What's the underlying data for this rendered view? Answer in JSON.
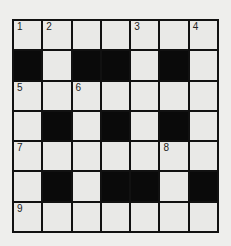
{
  "puzzle": {
    "type": "crossword",
    "rows": 7,
    "cols": 7,
    "colors": {
      "black": "#0a0a0a",
      "white": "#e9e9e7",
      "border": "#111111"
    },
    "grid": [
      [
        {
          "b": false,
          "n": "1"
        },
        {
          "b": false,
          "n": "2"
        },
        {
          "b": false,
          "n": ""
        },
        {
          "b": false,
          "n": ""
        },
        {
          "b": false,
          "n": "3"
        },
        {
          "b": false,
          "n": ""
        },
        {
          "b": false,
          "n": "4"
        }
      ],
      [
        {
          "b": true,
          "n": ""
        },
        {
          "b": false,
          "n": ""
        },
        {
          "b": true,
          "n": ""
        },
        {
          "b": true,
          "n": ""
        },
        {
          "b": false,
          "n": ""
        },
        {
          "b": true,
          "n": ""
        },
        {
          "b": false,
          "n": ""
        }
      ],
      [
        {
          "b": false,
          "n": "5"
        },
        {
          "b": false,
          "n": ""
        },
        {
          "b": false,
          "n": "6"
        },
        {
          "b": false,
          "n": ""
        },
        {
          "b": false,
          "n": ""
        },
        {
          "b": false,
          "n": ""
        },
        {
          "b": false,
          "n": ""
        }
      ],
      [
        {
          "b": false,
          "n": ""
        },
        {
          "b": true,
          "n": ""
        },
        {
          "b": false,
          "n": ""
        },
        {
          "b": true,
          "n": ""
        },
        {
          "b": false,
          "n": ""
        },
        {
          "b": true,
          "n": ""
        },
        {
          "b": false,
          "n": ""
        }
      ],
      [
        {
          "b": false,
          "n": "7"
        },
        {
          "b": false,
          "n": ""
        },
        {
          "b": false,
          "n": ""
        },
        {
          "b": false,
          "n": ""
        },
        {
          "b": false,
          "n": ""
        },
        {
          "b": false,
          "n": "8"
        },
        {
          "b": false,
          "n": ""
        }
      ],
      [
        {
          "b": false,
          "n": ""
        },
        {
          "b": true,
          "n": ""
        },
        {
          "b": false,
          "n": ""
        },
        {
          "b": true,
          "n": ""
        },
        {
          "b": true,
          "n": ""
        },
        {
          "b": false,
          "n": ""
        },
        {
          "b": true,
          "n": ""
        }
      ],
      [
        {
          "b": false,
          "n": "9"
        },
        {
          "b": false,
          "n": ""
        },
        {
          "b": false,
          "n": ""
        },
        {
          "b": false,
          "n": ""
        },
        {
          "b": false,
          "n": ""
        },
        {
          "b": false,
          "n": ""
        },
        {
          "b": false,
          "n": ""
        }
      ]
    ]
  }
}
